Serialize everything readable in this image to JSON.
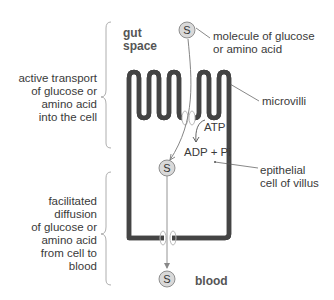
{
  "diagram": {
    "regions": {
      "gut_space": [
        "gut",
        "space"
      ],
      "blood": "blood"
    },
    "molecule_symbol": "S",
    "labels": {
      "molecule": [
        "molecule of glucose",
        "or amino acid"
      ],
      "microvilli": "microvilli",
      "atp": "ATP",
      "adp_pi": "ADP + Pi",
      "epithelial_cell": [
        "epithelial",
        "cell of villus"
      ]
    },
    "processes": {
      "active_transport": [
        "active transport",
        "of glucose or",
        "amino acid",
        "into the cell"
      ],
      "facilitated_diffusion": [
        "facilitated",
        "diffusion",
        "of glucose or",
        "amino acid",
        "from cell to",
        "blood"
      ]
    },
    "colors": {
      "membrane_outer": "#444444",
      "membrane_inner": "#e8e8e8",
      "circle_fill": "#d9d9d9",
      "circle_stroke": "#777777",
      "channel_stroke": "#bbbbbb",
      "leader_line": "#555555",
      "brace": "#999999"
    }
  }
}
